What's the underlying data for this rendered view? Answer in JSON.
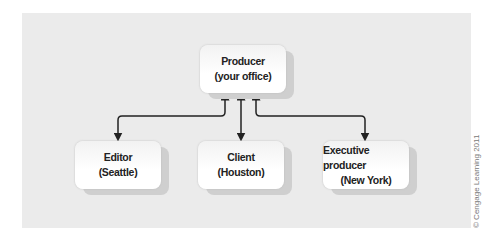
{
  "diagram": {
    "nodes": {
      "producer": {
        "title": "Producer",
        "subtitle": "(your office)"
      },
      "editor": {
        "title": "Editor",
        "subtitle": "(Seattle)"
      },
      "client": {
        "title": "Client",
        "subtitle": "(Houston)"
      },
      "executive": {
        "title": "Executive producer",
        "subtitle": "(New York)"
      }
    },
    "edges": [
      {
        "from": "producer",
        "to": "editor",
        "type": "bidirectional"
      },
      {
        "from": "producer",
        "to": "client",
        "type": "bidirectional"
      },
      {
        "from": "producer",
        "to": "executive",
        "type": "bidirectional"
      }
    ],
    "colors": {
      "panel": "#ebebeb",
      "box": "#ffffff",
      "shadow": "#cfcfcf",
      "arrow": "#222222"
    }
  },
  "credit": "© Cengage Learning 2011"
}
